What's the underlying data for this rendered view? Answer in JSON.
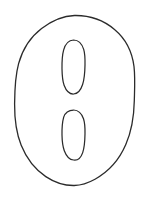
{
  "canvas": {
    "width": 156,
    "height": 198,
    "background_color": "#ffffff",
    "title": "hand-drawn line sketch"
  },
  "style": {
    "stroke_color": "#2b2b2b",
    "stroke_width": 1.3,
    "fill": "none",
    "rendering": "hand-drawn wobbly contour"
  },
  "chart_data": {
    "type": "scatter",
    "title": "",
    "xlabel": "",
    "ylabel": "",
    "grid": false,
    "legend": "none",
    "xlim": [
      0,
      156
    ],
    "ylim": [
      0,
      198
    ],
    "shapes": [
      {
        "name": "outer-ellipse",
        "kind": "ellipse",
        "cx": 74.5,
        "cy": 100.5,
        "rx": 60.0,
        "ry": 85.0,
        "stroke": "#2b2b2b",
        "fill": "none",
        "bounds": {
          "left": 14.5,
          "top": 15.5,
          "right": 134.5,
          "bottom": 185.5
        }
      },
      {
        "name": "upper-inner-ellipse",
        "kind": "ellipse",
        "cx": 73.5,
        "cy": 67.0,
        "rx": 11.5,
        "ry": 27.0,
        "stroke": "#2b2b2b",
        "fill": "none",
        "bounds": {
          "left": 62.0,
          "top": 40.0,
          "right": 85.0,
          "bottom": 94.0
        }
      },
      {
        "name": "lower-inner-ellipse",
        "kind": "ellipse",
        "cx": 73.5,
        "cy": 135.0,
        "rx": 11.5,
        "ry": 25.0,
        "stroke": "#2b2b2b",
        "fill": "none",
        "bounds": {
          "left": 62.0,
          "top": 110.0,
          "right": 85.0,
          "bottom": 160.0
        }
      }
    ]
  },
  "paths": {
    "outer_ellipse": "M 74.5 15.5 C 90 15.2 104 20.6 114.5 29.4 C 125.4 38.5 132.2 51.8 134.0 66.5 C 135.3 77.6 134.6 89.5 134.3 100.8 C 134.0 115.8 131.7 131.0 125.8 144.6 C 119.6 159.0 109.0 171.6 95.0 179.2 C 88.5 182.8 81.4 185.3 74.2 185.5 C 64.0 185.7 54.2 182.2 45.8 176.6 C 34.6 169.1 26.2 157.8 21.2 145.3 C 16.0 132.3 14.5 118.0 14.6 104.0 C 14.7 90.5 15.0 76.8 18.6 63.7 C 22.3 50.0 30.2 37.2 41.6 28.5 C 51.0 21.3 62.5 15.9 74.5 15.5 Z",
    "upper_inner_ellipse": "M 73.6 40.0 C 78.4 40.1 82.1 44.4 83.7 49.4 C 85.2 54.3 85.1 59.8 85.0 65.0 C 84.9 71.6 84.6 78.4 82.6 84.5 C 81.1 89.2 78.1 93.7 73.6 94.0 C 69.0 94.2 65.8 89.8 64.1 85.2 C 62.3 80.1 62.1 74.3 62.0 68.9 C 61.9 62.6 62.0 56.0 63.6 50.1 C 65.0 44.9 68.3 40.2 73.6 40.0 Z",
    "lower_inner_ellipse": "M 73.6 110.0 C 78.3 110.1 81.9 114.1 83.5 118.8 C 85.1 123.5 85.1 128.8 85.0 133.8 C 84.9 140.2 84.7 146.8 82.7 152.6 C 81.2 157.0 78.2 160.7 73.6 160.0 C 69.1 159.8 66.0 155.4 64.3 150.8 C 62.5 145.9 62.1 140.3 62.0 135.1 C 61.9 129.1 62.1 122.8 63.7 117.2 C 65.2 112.3 68.5 110.0 73.6 110.0 Z"
  }
}
